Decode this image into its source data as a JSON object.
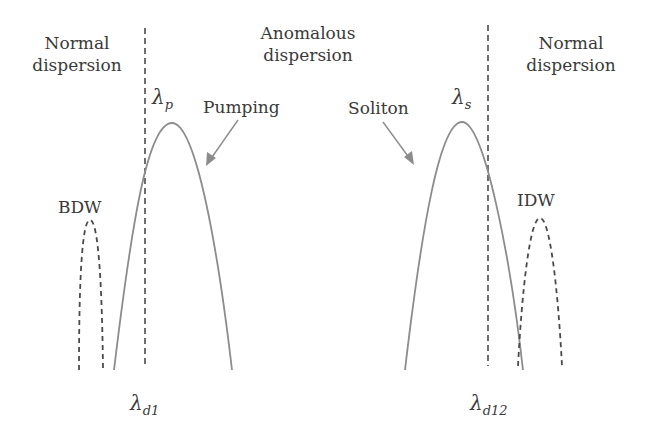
{
  "regions": {
    "left": {
      "line1": "Normal",
      "line2": "dispersion"
    },
    "middle": {
      "line1": "Anomalous",
      "line2": "dispersion"
    },
    "right": {
      "line1": "Normal",
      "line2": "dispersion"
    }
  },
  "peaks": {
    "pump": {
      "symbol": "λ",
      "subscript": "p"
    },
    "soliton": {
      "symbol": "λ",
      "subscript": "s"
    }
  },
  "annotations": {
    "pumping": "Pumping",
    "soliton": "Soliton",
    "bdw": "BDW",
    "idw": "IDW"
  },
  "boundaries": {
    "left": {
      "symbol": "λ",
      "subscript": "d1"
    },
    "right": {
      "symbol": "λ",
      "subscript": "d12"
    }
  },
  "colors": {
    "solid_curve": "#8c8c8c",
    "dashed": "#4a4a4a",
    "arrow": "#8c8c8c",
    "text": "#3a3a3a"
  }
}
